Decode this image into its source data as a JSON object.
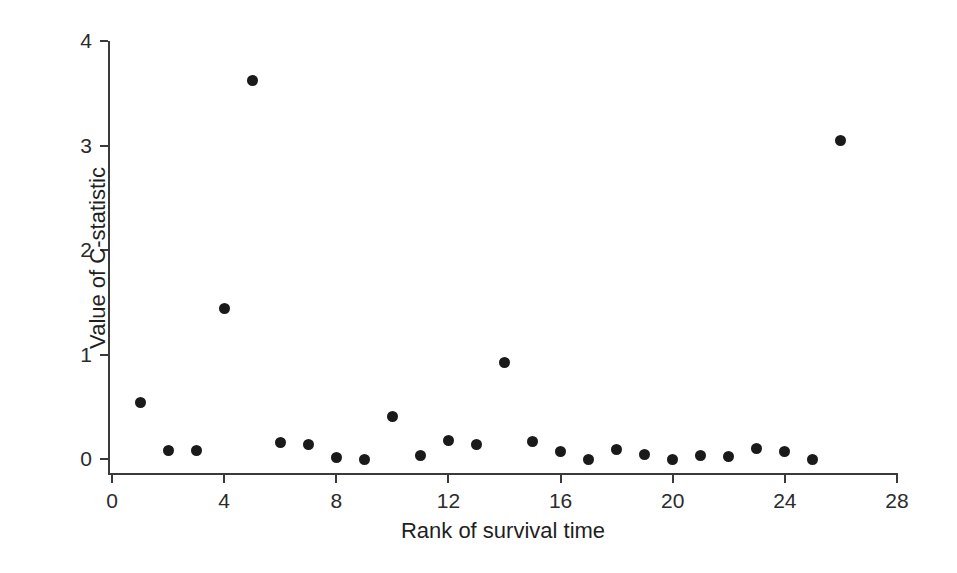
{
  "chart_data": {
    "type": "scatter",
    "title": "",
    "xlabel": "Rank of survival time",
    "ylabel": "Value of C-statistic",
    "xlim": [
      0,
      28
    ],
    "ylim": [
      0,
      4
    ],
    "xticks": [
      0,
      4,
      8,
      12,
      16,
      20,
      24,
      28
    ],
    "yticks": [
      0,
      1,
      2,
      3,
      4
    ],
    "xtick_labels": [
      "0",
      "4",
      "8",
      "12",
      "16",
      "20",
      "24",
      "28"
    ],
    "ytick_labels": [
      "0",
      "1",
      "2",
      "3",
      "4"
    ],
    "grid": false,
    "legend": null,
    "marker": "filled-circle",
    "marker_color": "#1a1a1a",
    "x": [
      1,
      2,
      3,
      4,
      5,
      6,
      7,
      8,
      9,
      10,
      11,
      12,
      13,
      14,
      15,
      16,
      17,
      18,
      19,
      20,
      21,
      22,
      23,
      24,
      25,
      26
    ],
    "y": [
      0.54,
      0.08,
      0.08,
      1.44,
      3.62,
      0.16,
      0.14,
      0.01,
      0.0,
      0.41,
      0.03,
      0.18,
      0.14,
      0.92,
      0.17,
      0.07,
      0.0,
      0.09,
      0.04,
      0.0,
      0.03,
      0.02,
      0.1,
      0.07,
      0.0,
      3.05
    ],
    "points": [
      {
        "rank": 1,
        "value": 0.54
      },
      {
        "rank": 2,
        "value": 0.08
      },
      {
        "rank": 3,
        "value": 0.08
      },
      {
        "rank": 4,
        "value": 1.44
      },
      {
        "rank": 5,
        "value": 3.62
      },
      {
        "rank": 6,
        "value": 0.16
      },
      {
        "rank": 7,
        "value": 0.14
      },
      {
        "rank": 8,
        "value": 0.01
      },
      {
        "rank": 9,
        "value": 0.0
      },
      {
        "rank": 10,
        "value": 0.41
      },
      {
        "rank": 11,
        "value": 0.03
      },
      {
        "rank": 12,
        "value": 0.18
      },
      {
        "rank": 13,
        "value": 0.14
      },
      {
        "rank": 14,
        "value": 0.92
      },
      {
        "rank": 15,
        "value": 0.17
      },
      {
        "rank": 16,
        "value": 0.07
      },
      {
        "rank": 17,
        "value": 0.0
      },
      {
        "rank": 18,
        "value": 0.09
      },
      {
        "rank": 19,
        "value": 0.04
      },
      {
        "rank": 20,
        "value": 0.0
      },
      {
        "rank": 21,
        "value": 0.03
      },
      {
        "rank": 22,
        "value": 0.02
      },
      {
        "rank": 23,
        "value": 0.1
      },
      {
        "rank": 24,
        "value": 0.07
      },
      {
        "rank": 25,
        "value": 0.0
      },
      {
        "rank": 26,
        "value": 3.05
      }
    ]
  },
  "figure": {
    "background_color": "#ffffff",
    "axis_color": "#3a3a3a"
  }
}
